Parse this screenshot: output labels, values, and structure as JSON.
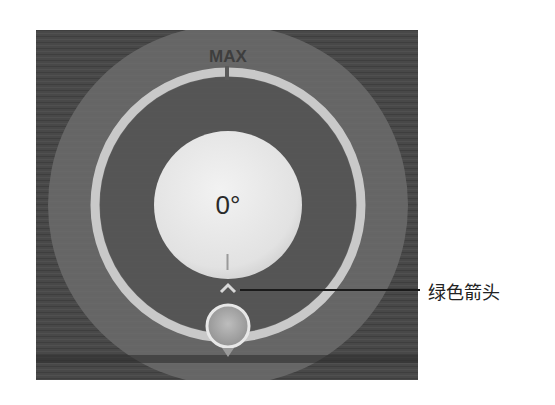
{
  "dial": {
    "max_label": "MAX",
    "angle_value": "0°",
    "colors": {
      "background": "#484848",
      "outer_disk": "#6a6a6a",
      "track_ring": "#c9c9c9",
      "center_disc": "#e6e6e6",
      "text": "#2a2a2a"
    }
  },
  "annotation": {
    "label": "绿色箭头",
    "target": "arrow-indicator"
  }
}
